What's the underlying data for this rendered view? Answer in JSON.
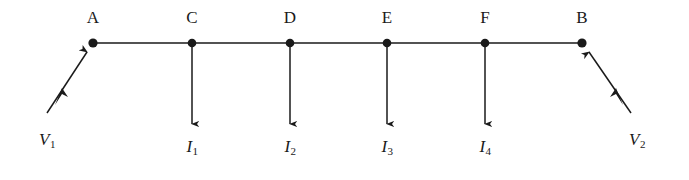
{
  "figure": {
    "background_color": "#ffffff",
    "ink_color": "#1a1a1a",
    "width": 689,
    "height": 180
  },
  "conductor": {
    "y": 43,
    "x_start": 93,
    "x_end": 582
  },
  "nodes": [
    {
      "id": "A",
      "label": "A",
      "x": 93,
      "y": 43,
      "label_x": 93,
      "label_y": 26
    },
    {
      "id": "C",
      "label": "C",
      "x": 192,
      "y": 43,
      "label_x": 192,
      "label_y": 26
    },
    {
      "id": "D",
      "label": "D",
      "x": 290,
      "y": 43,
      "label_x": 290,
      "label_y": 26
    },
    {
      "id": "E",
      "label": "E",
      "x": 387,
      "y": 43,
      "label_x": 387,
      "label_y": 26
    },
    {
      "id": "F",
      "label": "F",
      "x": 485,
      "y": 43,
      "label_x": 485,
      "label_y": 26
    },
    {
      "id": "B",
      "label": "B",
      "x": 582,
      "y": 43,
      "label_x": 582,
      "label_y": 26
    }
  ],
  "current_arrows": [
    {
      "id": "I1",
      "symbol": "I",
      "subscript": "1",
      "from_node": "C",
      "x": 192,
      "y_start": 43,
      "y_tip": 131,
      "label_x": 192,
      "label_y": 155
    },
    {
      "id": "I2",
      "symbol": "I",
      "subscript": "2",
      "from_node": "D",
      "x": 290,
      "y_start": 43,
      "y_tip": 131,
      "label_x": 290,
      "label_y": 155
    },
    {
      "id": "I3",
      "symbol": "I",
      "subscript": "3",
      "from_node": "E",
      "x": 387,
      "y_start": 43,
      "y_tip": 131,
      "label_x": 387,
      "label_y": 155
    },
    {
      "id": "I4",
      "symbol": "I",
      "subscript": "4",
      "from_node": "F",
      "x": 485,
      "y_start": 43,
      "y_tip": 131,
      "label_x": 485,
      "label_y": 155
    }
  ],
  "voltage_arrows": [
    {
      "id": "V1",
      "symbol": "V",
      "subscript": "1",
      "to_node": "A",
      "x_tail": 47,
      "y_tail": 113,
      "x_tip": 90,
      "y_tip": 47,
      "label_x": 47,
      "label_y": 148
    },
    {
      "id": "V2",
      "symbol": "V",
      "subscript": "2",
      "to_node": "B",
      "x_tail": 631,
      "y_tail": 113,
      "x_tip": 586,
      "y_tip": 47,
      "label_x": 637,
      "label_y": 148
    }
  ]
}
